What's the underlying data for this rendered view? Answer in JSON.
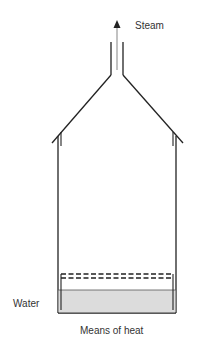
{
  "diagram": {
    "labels": {
      "steam": "Steam",
      "water": "Water",
      "means_of_heat": "Means of heat"
    },
    "colors": {
      "line": "#222222",
      "water_fill": "#dcdcdc",
      "steam_arrow": "#999999",
      "text": "#333333"
    }
  }
}
